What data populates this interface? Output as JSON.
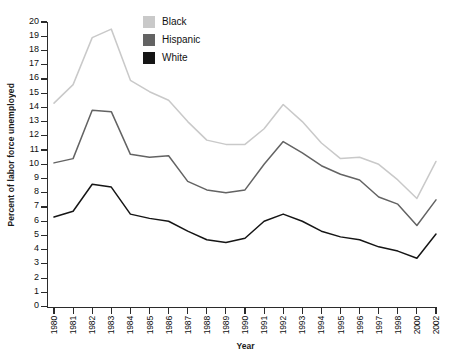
{
  "chart_data": {
    "type": "line",
    "title": "",
    "xlabel": "Year",
    "ylabel": "Percent of labor force unemployed",
    "xlim": [
      1980,
      2002
    ],
    "ylim": [
      0,
      20
    ],
    "grid": false,
    "legend_position": "top-center",
    "x_tick_labels": [
      "1980",
      "1981",
      "1982",
      "1983",
      "1984",
      "1985",
      "1986",
      "1987",
      "1988",
      "1989",
      "1990",
      "1991",
      "1992",
      "1993",
      "1994",
      "1995",
      "1996",
      "1997",
      "1998",
      "2000",
      "2002"
    ],
    "y_tick_labels": [
      "0",
      "1",
      "2",
      "3",
      "4",
      "5",
      "6",
      "7",
      "8",
      "9",
      "10",
      "11",
      "12",
      "13",
      "14",
      "15",
      "16",
      "17",
      "18",
      "19",
      "20"
    ],
    "categories": [
      1980,
      1981,
      1982,
      1983,
      1984,
      1985,
      1986,
      1987,
      1988,
      1989,
      1990,
      1991,
      1992,
      1993,
      1994,
      1995,
      1996,
      1997,
      1998,
      2000,
      2002
    ],
    "series": [
      {
        "name": "Black",
        "color": "#c9c9c9",
        "values": [
          14.3,
          15.6,
          18.9,
          19.5,
          15.9,
          15.1,
          14.5,
          13.0,
          11.7,
          11.4,
          11.4,
          12.5,
          14.2,
          13.0,
          11.5,
          10.4,
          10.5,
          10.0,
          8.9,
          7.6,
          10.2
        ]
      },
      {
        "name": "Hispanic",
        "color": "#636363",
        "values": [
          10.1,
          10.4,
          13.8,
          13.7,
          10.7,
          10.5,
          10.6,
          8.8,
          8.2,
          8.0,
          8.2,
          10.0,
          11.6,
          10.8,
          9.9,
          9.3,
          8.9,
          7.7,
          7.2,
          5.7,
          7.5
        ]
      },
      {
        "name": "White",
        "color": "#151515",
        "values": [
          6.3,
          6.7,
          8.6,
          8.4,
          6.5,
          6.2,
          6.0,
          5.3,
          4.7,
          4.5,
          4.8,
          6.0,
          6.5,
          6.0,
          5.3,
          4.9,
          4.7,
          4.2,
          3.9,
          3.4,
          5.1
        ]
      }
    ]
  },
  "legend": {
    "items": [
      {
        "label": "Black",
        "color": "#c9c9c9"
      },
      {
        "label": "Hispanic",
        "color": "#636363"
      },
      {
        "label": "White",
        "color": "#151515"
      }
    ]
  },
  "axes": {
    "x_title": "Year",
    "y_title": "Percent of labor force unemployed"
  }
}
